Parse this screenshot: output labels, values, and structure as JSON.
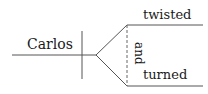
{
  "diagram": {
    "type": "sentence-diagram",
    "subject": "Carlos",
    "predicates": [
      "twisted",
      "turned"
    ],
    "conjunction": "and",
    "colors": {
      "text": "#1a1a1a",
      "lines": "#555555"
    }
  }
}
